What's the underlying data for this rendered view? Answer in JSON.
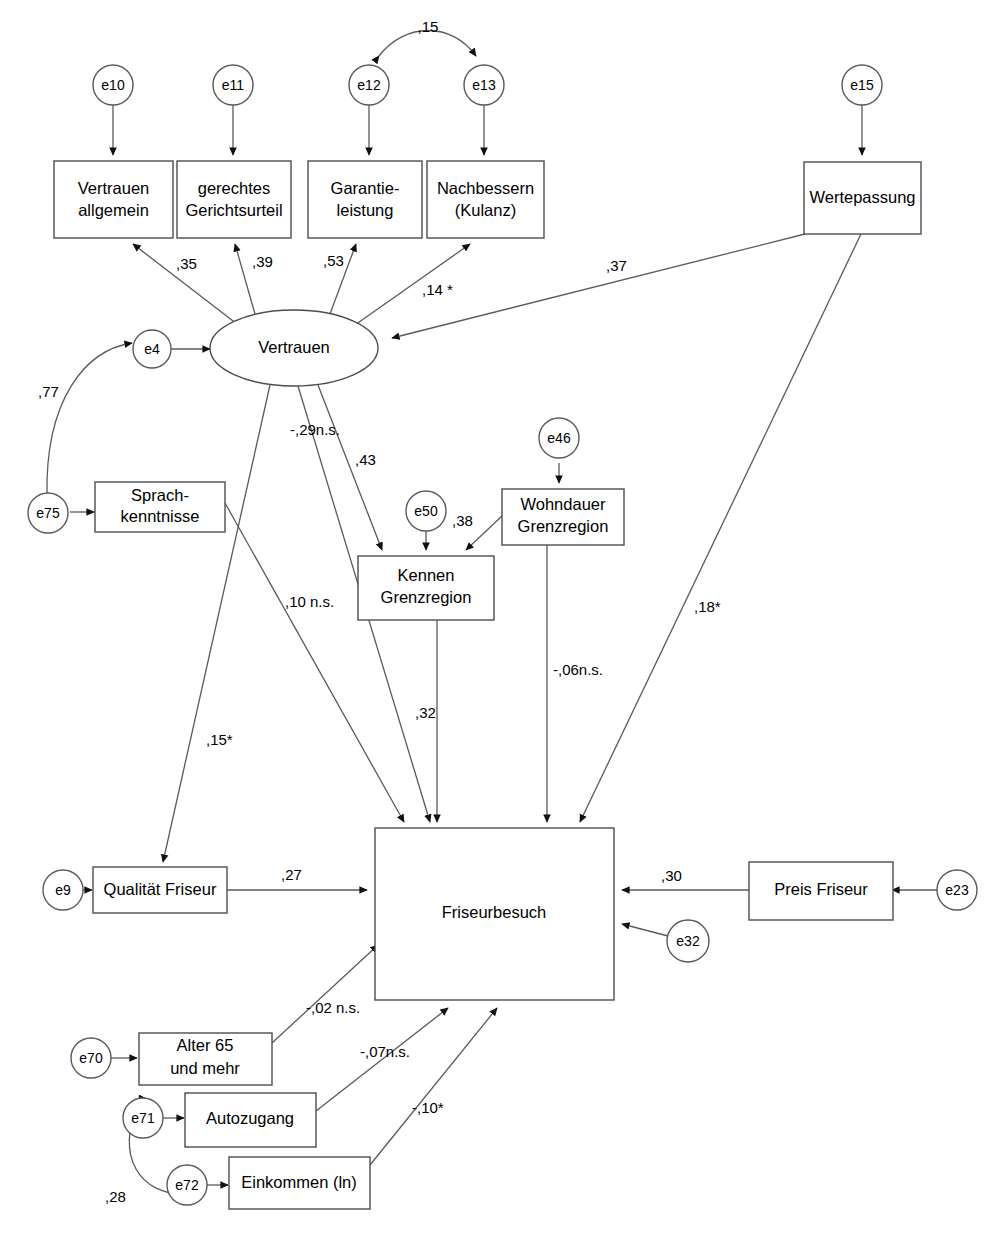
{
  "diagram": {
    "type": "sem-path-diagram",
    "line_color": "#5a5a5a",
    "fill_color": "#ffffff",
    "text_color": "#000000"
  },
  "nodes": {
    "vertrauen_allgemein": {
      "label_line1": "Vertrauen",
      "label_line2": "allgemein"
    },
    "gerechtes_gerichtsurteil": {
      "label_line1": "gerechtes",
      "label_line2": "Gerichtsurteil"
    },
    "garantieleistung": {
      "label_line1": "Garantie-",
      "label_line2": "leistung"
    },
    "nachbessern": {
      "label_line1": "Nachbessern",
      "label_line2": "(Kulanz)"
    },
    "wertepassung": {
      "label_line1": "Wertepassung",
      "label_line2": ""
    },
    "vertrauen": {
      "label_line1": "Vertrauen",
      "label_line2": ""
    },
    "sprachkenntnisse": {
      "label_line1": "Sprach-",
      "label_line2": "kenntnisse"
    },
    "kennen_grenzregion": {
      "label_line1": "Kennen",
      "label_line2": "Grenzregion"
    },
    "wohndauer_grenzregion": {
      "label_line1": "Wohndauer",
      "label_line2": "Grenzregion"
    },
    "friseurbesuch": {
      "label_line1": "Friseurbesuch",
      "label_line2": ""
    },
    "qualitaet_friseur": {
      "label_line1": "Qualität Friseur",
      "label_line2": ""
    },
    "preis_friseur": {
      "label_line1": "Preis Friseur",
      "label_line2": ""
    },
    "alter_65": {
      "label_line1": "Alter 65",
      "label_line2": "und mehr"
    },
    "autozugang": {
      "label_line1": "Autozugang",
      "label_line2": ""
    },
    "einkommen": {
      "label_line1": "Einkommen (ln)",
      "label_line2": ""
    }
  },
  "errors": {
    "e10": "e10",
    "e11": "e11",
    "e12": "e12",
    "e13": "e13",
    "e15": "e15",
    "e4": "e4",
    "e75": "e75",
    "e50": "e50",
    "e46": "e46",
    "e9": "e9",
    "e23": "e23",
    "e32": "e32",
    "e70": "e70",
    "e71": "e71",
    "e72": "e72"
  },
  "coefficients": {
    "e12_e13_cov": ",15",
    "vertrauen_to_vertrauen_allgemein": ",35",
    "vertrauen_to_gerechtes": ",39",
    "vertrauen_to_garantie": ",53",
    "vertrauen_to_nachbessern": ",14 *",
    "wertepassung_to_vertrauen": ",37",
    "e75_e4_cov": ",77",
    "vertrauen_to_friseurbesuch_ns": "-,29n.s.",
    "vertrauen_to_kennen": ",43",
    "wohndauer_to_kennen": ",38",
    "sprach_to_friseurbesuch_ns": ",10 n.s.",
    "sprach_to_qualitaet": ",15*",
    "kennen_to_friseurbesuch": ",32",
    "wohndauer_to_friseurbesuch_ns": "-,06n.s.",
    "wertepassung_to_friseurbesuch": ",18*",
    "qualitaet_to_friseurbesuch": ",27",
    "preis_to_friseurbesuch": ",30",
    "alter_to_friseurbesuch_ns": "-,02 n.s.",
    "autozugang_to_friseurbesuch_ns": "-,07n.s.",
    "einkommen_to_friseurbesuch": "-,10*",
    "e71_e72_cov": ",28"
  }
}
